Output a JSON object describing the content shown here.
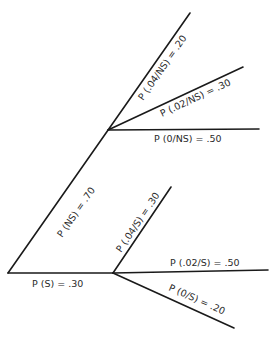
{
  "diagram": {
    "type": "probability-tree",
    "root": {
      "x": 8,
      "y": 273
    },
    "nodes": {
      "NS": {
        "x": 108,
        "y": 130
      },
      "S": {
        "x": 113,
        "y": 273
      }
    },
    "edges": [
      {
        "id": "root-NS",
        "from": [
          8,
          273
        ],
        "to": [
          108,
          130
        ],
        "label": "P (NS) = .70"
      },
      {
        "id": "root-S",
        "from": [
          8,
          273
        ],
        "to": [
          113,
          273
        ],
        "label": "P (S) = .30"
      },
      {
        "id": "NS-04",
        "from": [
          108,
          130
        ],
        "to": [
          190,
          13
        ],
        "label": "P (.04/NS) = .20"
      },
      {
        "id": "NS-02",
        "from": [
          108,
          130
        ],
        "to": [
          243,
          67
        ],
        "label": "P (.02/NS) = .30"
      },
      {
        "id": "NS-0",
        "from": [
          108,
          130
        ],
        "to": [
          259,
          129
        ],
        "label": "P (0/NS) = .50"
      },
      {
        "id": "S-04",
        "from": [
          113,
          273
        ],
        "to": [
          171,
          187
        ],
        "label": "P (.04/S) = .30"
      },
      {
        "id": "S-02",
        "from": [
          113,
          273
        ],
        "to": [
          268,
          270
        ],
        "label": "P (.02/S) = .50"
      },
      {
        "id": "S-0",
        "from": [
          113,
          273
        ],
        "to": [
          234,
          328
        ],
        "label": "P (0/S) = .20"
      }
    ]
  },
  "labels": {
    "p_ns": "P (NS) = .70",
    "p_s": "P (S) = .30",
    "p_04_ns": "P (.04/NS) = .20",
    "p_02_ns": "P (.02/NS) = .30",
    "p_0_ns": "P (0/NS) = .50",
    "p_04_s": "P (.04/S) = .30",
    "p_02_s": "P (.02/S) = .50",
    "p_0_s": "P (0/S) = .20"
  }
}
